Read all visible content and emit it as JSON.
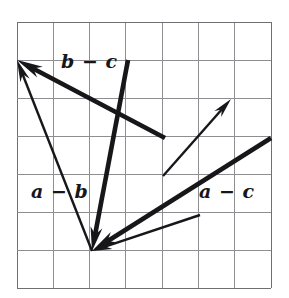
{
  "figure": {
    "background_color": "#ffffff",
    "grid": {
      "columns": 7,
      "rows": 7,
      "x0": 17,
      "y0": 22,
      "x1": 271,
      "y1": 288,
      "cell_width": 36.29,
      "cell_height": 38.0,
      "line_color": "#8d8d92",
      "border_color": "#6f6f74",
      "line_width": 1
    },
    "ink_color": "#17171a",
    "labels": [
      {
        "id": "bc",
        "text": "b − c",
        "x": 61,
        "y": 52
      },
      {
        "id": "ab",
        "text": "a − b",
        "x": 31,
        "y": 182
      },
      {
        "id": "ac",
        "text": "a − c",
        "x": 199,
        "y": 182
      }
    ],
    "vectors": [
      {
        "id": "a-minus-b",
        "label": "a − b",
        "weight": "thin",
        "stroke_width": 2.4,
        "from": {
          "x": 92,
          "y": 251
        },
        "to": {
          "x": 17,
          "y": 60
        },
        "arrowhead": "to",
        "head_length": 22,
        "head_half_width": 5.0
      },
      {
        "id": "b-minus-c",
        "label": "b − c",
        "weight": "bold",
        "stroke_width": 4.6,
        "from": {
          "x": 165,
          "y": 138
        },
        "to": {
          "x": 17,
          "y": 60
        },
        "arrowhead": "to",
        "head_length": 26,
        "head_half_width": 6.0
      },
      {
        "id": "b-steep",
        "label": "",
        "weight": "bold",
        "stroke_width": 4.6,
        "from": {
          "x": 128,
          "y": 60
        },
        "to": {
          "x": 92,
          "y": 251
        },
        "arrowhead": "to",
        "head_length": 24,
        "head_half_width": 6.0
      },
      {
        "id": "c-thin-right",
        "label": "",
        "weight": "thin",
        "stroke_width": 2.4,
        "from": {
          "x": 163,
          "y": 176
        },
        "to": {
          "x": 231,
          "y": 99
        },
        "arrowhead": "to",
        "head_length": 20,
        "head_half_width": 4.6
      },
      {
        "id": "a-minus-c",
        "label": "a − c",
        "weight": "bold",
        "stroke_width": 4.6,
        "from": {
          "x": 271,
          "y": 138
        },
        "to": {
          "x": 92,
          "y": 251
        },
        "arrowhead": "to",
        "head_length": 26,
        "head_half_width": 6.0
      },
      {
        "id": "a-minus-c-thin",
        "label": "",
        "weight": "thin",
        "stroke_width": 2.4,
        "from": {
          "x": 200,
          "y": 215
        },
        "to": {
          "x": 92,
          "y": 251
        },
        "arrowhead": "to",
        "head_length": 20,
        "head_half_width": 4.6
      }
    ]
  }
}
